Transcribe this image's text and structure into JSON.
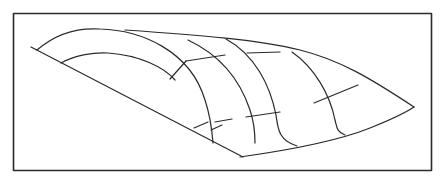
{
  "figure": {
    "type": "line-drawing",
    "colors": {
      "stroke": "#2a2a2a",
      "background": "#ffffff"
    },
    "elements": [
      "frame",
      "base-edge",
      "outer-arc",
      "inner-arc",
      "top-ridge",
      "meridian-1",
      "meridian-2",
      "meridian-3",
      "bottom-edge",
      "cross-line-segments"
    ]
  }
}
